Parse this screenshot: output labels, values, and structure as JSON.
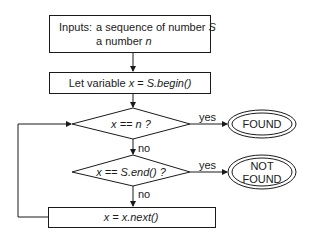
{
  "flowchart": {
    "input_box": {
      "label_prefix": "Inputs:",
      "line1_text": "a sequence of number",
      "line1_var": "S",
      "line2_text": "a number",
      "line2_var": "n"
    },
    "init_box": {
      "text": "Let variable",
      "expr_var": "x",
      "expr_eq": " = ",
      "expr_call": "S.begin()"
    },
    "decision1": {
      "text": "x == n ?"
    },
    "decision2": {
      "text": "x == S.end() ?"
    },
    "next_box": {
      "text": "x = x.next()"
    },
    "edge_labels": {
      "d1_yes": "yes",
      "d1_no": "no",
      "d2_yes": "yes",
      "d2_no": "no"
    },
    "terminal_found": {
      "text": "FOUND"
    },
    "terminal_not_found": {
      "line1": "NOT",
      "line2": "FOUND"
    }
  },
  "colors": {
    "stroke": "#1a1a1a",
    "background": "#ffffff"
  }
}
